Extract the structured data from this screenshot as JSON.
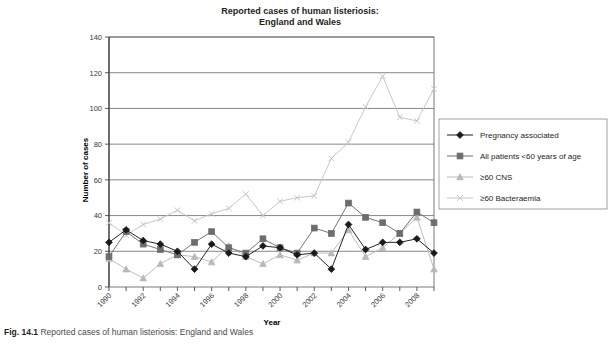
{
  "figure": {
    "caption_number": "Fig. 14.1",
    "caption_text": "Reported cases of human listeriosis: England and Wales"
  },
  "chart_data": {
    "type": "line",
    "title": "Reported cases of human listeriosis: England and Wales",
    "title_line1": "Reported cases of human listeriosis:",
    "title_line2": "England and Wales",
    "xlabel": "Year",
    "ylabel": "Number of cases",
    "ylim": [
      0,
      140
    ],
    "ytick_step": 20,
    "yticks": [
      0,
      20,
      40,
      60,
      80,
      100,
      120,
      140
    ],
    "grid": true,
    "grid_axis": "y",
    "legend_position": "right",
    "x": [
      1990,
      1991,
      1992,
      1993,
      1994,
      1995,
      1996,
      1997,
      1998,
      1999,
      2000,
      2001,
      2002,
      2003,
      2004,
      2005,
      2006,
      2007,
      2008,
      2009
    ],
    "xtick_labels": [
      "1990",
      "",
      "1992",
      "",
      "1994",
      "",
      "1996",
      "",
      "1998",
      "",
      "2000",
      "",
      "2002",
      "",
      "2004",
      "",
      "2006",
      "",
      "2008",
      ""
    ],
    "xtick_labels_shown": [
      "1990",
      "1992",
      "1994",
      "1996",
      "1998",
      "2000",
      "2002",
      "2004",
      "2006",
      "2008"
    ],
    "series": [
      {
        "name": "Pregnancy associated",
        "marker": "diamond",
        "color": "#1a1a1a",
        "values": [
          25,
          32,
          26,
          24,
          20,
          10,
          24,
          19,
          17,
          23,
          22,
          18,
          19,
          10,
          35,
          21,
          25,
          25,
          27,
          19
        ]
      },
      {
        "name": "All patients <60 years of age",
        "marker": "square",
        "color": "#6d6d6d",
        "values": [
          17,
          31,
          24,
          21,
          18,
          25,
          31,
          22,
          19,
          27,
          22,
          19,
          33,
          30,
          47,
          39,
          36,
          30,
          42,
          36
        ]
      },
      {
        "name": "≥60 CNS",
        "marker": "triangle",
        "color": "#b9b9b9",
        "values": [
          16,
          10,
          5,
          13,
          18,
          17,
          14,
          23,
          17,
          13,
          18,
          15,
          19,
          19,
          32,
          17,
          22,
          30,
          39,
          10
        ]
      },
      {
        "name": "≥60 Bacteraemia",
        "marker": "cross",
        "color": "#c4c4c4",
        "values": [
          36,
          29,
          35,
          38,
          43,
          37,
          41,
          44,
          52,
          40,
          48,
          50,
          51,
          72,
          81,
          101,
          118,
          95,
          93,
          111
        ]
      }
    ],
    "annotations": []
  },
  "legend": {
    "entries": [
      {
        "label": "Pregnancy associated",
        "marker": "diamond-marker"
      },
      {
        "label": "All patients <60 years of age",
        "marker": "square-marker"
      },
      {
        "label": "≥60 CNS",
        "marker": "triangle-marker"
      },
      {
        "label": "≥60 Bacteraemia",
        "marker": "cross-marker"
      }
    ]
  }
}
